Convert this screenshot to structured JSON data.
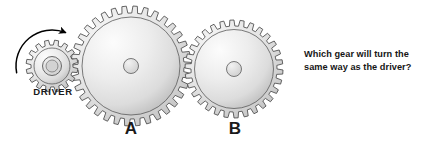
{
  "page": {
    "background_color": "#ffffff",
    "width": 427,
    "height": 143
  },
  "question": {
    "full_text": "Which gear will turn the same way as the driver?",
    "line1": "Which gear will turn the",
    "line2": "same way as the driver?",
    "color": "#161616"
  },
  "labels": {
    "driver": "DRIVER",
    "gear_a": "A",
    "gear_b": "B"
  },
  "rotation_arrow": {
    "name": "counterclockwise-rotation-arrow",
    "direction": "counterclockwise",
    "color": "#000000"
  },
  "gears": [
    {
      "id": "driver",
      "label": "DRIVER",
      "cx": 52,
      "cy": 66,
      "outer_radius": 26,
      "root_radius": 21,
      "rim_radius": 18,
      "hub_radius": 9.5,
      "bore_radius": 6,
      "teeth": 16,
      "body_color": "#dcdcdc",
      "edge_color": "#4a4a4a"
    },
    {
      "id": "gear_a",
      "label": "A",
      "cx": 131,
      "cy": 66,
      "outer_radius": 60,
      "root_radius": 53,
      "rim_radius": 49,
      "hub_radius": 7.5,
      "bore_radius": 5,
      "teeth": 34,
      "body_color": "#dcdcdc",
      "edge_color": "#4a4a4a"
    },
    {
      "id": "gear_b",
      "label": "B",
      "cx": 234,
      "cy": 69,
      "outer_radius": 49,
      "root_radius": 43,
      "rim_radius": 39.5,
      "hub_radius": 7.5,
      "bore_radius": 5,
      "teeth": 30,
      "body_color": "#dcdcdc",
      "edge_color": "#4a4a4a"
    }
  ],
  "colors": {
    "gear_light": "#fbfbfb",
    "gear_mid": "#e2e2e2",
    "gear_dark": "#b8b8b8",
    "gear_stroke": "#4a4a4a",
    "text": "#161616"
  }
}
